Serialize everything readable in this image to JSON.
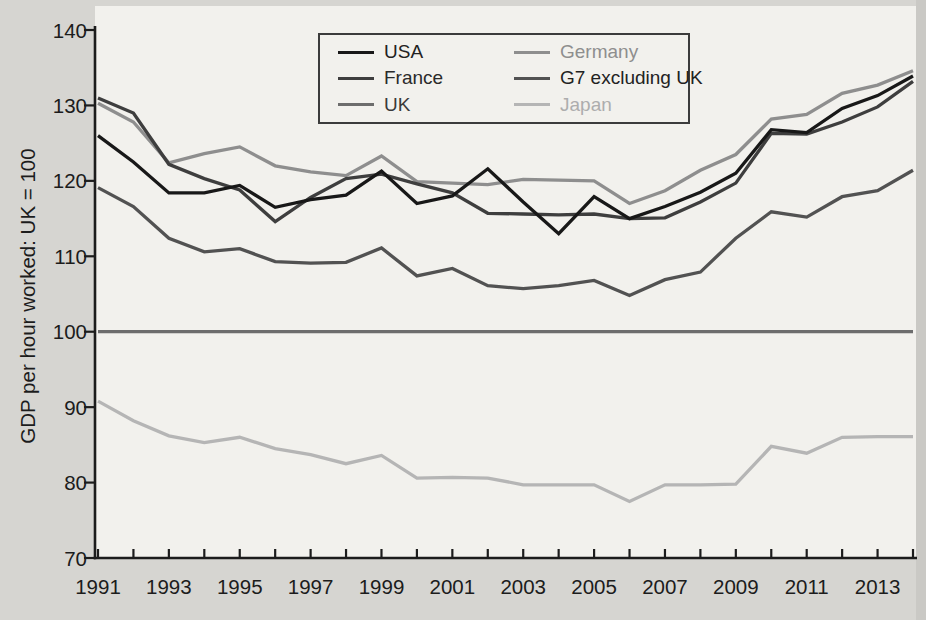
{
  "page": {
    "background": "#d6d5d1",
    "plot_background": "#f2f1ed",
    "axis_color": "#1c1c1c",
    "scan_edge_color": "#c7c6c2"
  },
  "chart_data": {
    "type": "line",
    "title": "",
    "xlabel": "",
    "ylabel": "GDP per hour worked: UK = 100",
    "ylim": [
      70,
      140
    ],
    "xlim": [
      1991,
      2014
    ],
    "grid": false,
    "legend_position": "top-center",
    "legend_columns": 2,
    "yticks": [
      70,
      80,
      90,
      100,
      110,
      120,
      130,
      140
    ],
    "xtick_labels": [
      "1991",
      "1993",
      "1995",
      "1997",
      "1999",
      "2001",
      "2003",
      "2005",
      "2007",
      "2009",
      "2011",
      "2013"
    ],
    "x": [
      1991,
      1992,
      1993,
      1994,
      1995,
      1996,
      1997,
      1998,
      1999,
      2000,
      2001,
      2002,
      2003,
      2004,
      2005,
      2006,
      2007,
      2008,
      2009,
      2010,
      2011,
      2012,
      2013,
      2014
    ],
    "series": [
      {
        "name": "USA",
        "color": "#181818",
        "label_color": "#222222",
        "values": [
          126.0,
          122.5,
          118.4,
          118.4,
          119.4,
          116.5,
          117.5,
          118.1,
          121.3,
          117.0,
          118.0,
          121.6,
          117.2,
          113.0,
          117.9,
          115.0,
          116.6,
          118.5,
          121.0,
          126.8,
          126.4,
          129.6,
          131.3,
          133.9
        ]
      },
      {
        "name": "France",
        "color": "#3e3e3e",
        "label_color": "#2a2a2a",
        "values": [
          131.0,
          129.0,
          122.2,
          120.3,
          118.8,
          114.6,
          117.8,
          120.3,
          120.9,
          119.6,
          118.4,
          115.7,
          115.6,
          115.5,
          115.6,
          115.0,
          115.1,
          117.2,
          119.7,
          126.3,
          126.2,
          127.8,
          129.8,
          133.2
        ]
      },
      {
        "name": "UK",
        "color": "#6d6d6d",
        "label_color": "#3a3a3a",
        "values": [
          100,
          100,
          100,
          100,
          100,
          100,
          100,
          100,
          100,
          100,
          100,
          100,
          100,
          100,
          100,
          100,
          100,
          100,
          100,
          100,
          100,
          100,
          100,
          100
        ]
      },
      {
        "name": "Germany",
        "color": "#8e8e8e",
        "label_color": "#8e8e8e",
        "values": [
          130.3,
          127.8,
          122.4,
          123.6,
          124.5,
          122.0,
          121.2,
          120.7,
          123.3,
          119.9,
          119.7,
          119.5,
          120.2,
          120.1,
          120.0,
          117.0,
          118.7,
          121.4,
          123.5,
          128.2,
          128.8,
          131.6,
          132.7,
          134.6
        ]
      },
      {
        "name": "G7 excluding UK",
        "color": "#525252",
        "label_color": "#222222",
        "values": [
          119.1,
          116.6,
          112.4,
          110.6,
          111.0,
          109.3,
          109.1,
          109.2,
          111.1,
          107.4,
          108.4,
          106.1,
          105.7,
          106.1,
          106.8,
          104.8,
          106.9,
          107.9,
          112.4,
          115.9,
          115.2,
          117.9,
          118.7,
          121.4
        ]
      },
      {
        "name": "Japan",
        "color": "#b5b5b5",
        "label_color": "#adadad",
        "values": [
          90.8,
          88.2,
          86.2,
          85.3,
          86.0,
          84.5,
          83.7,
          82.5,
          83.6,
          80.6,
          80.7,
          80.6,
          79.7,
          79.7,
          79.7,
          77.5,
          79.7,
          79.7,
          79.8,
          84.8,
          83.9,
          86.0,
          86.1,
          86.1
        ]
      }
    ],
    "draw_order": [
      5,
      3,
      2,
      4,
      1,
      0
    ]
  }
}
